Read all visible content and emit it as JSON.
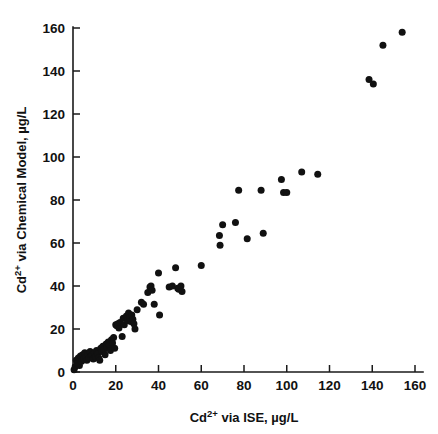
{
  "chart_data": {
    "type": "scatter",
    "title": "",
    "xlabel": "Cd2+ via ISE, µg/L",
    "ylabel": "Cd2+ via Chemical Model, µg/L",
    "xlabel_parts": {
      "prefix": "Cd",
      "sup": "2+",
      "suffix": " via ISE, µg/L"
    },
    "ylabel_parts": {
      "prefix": "Cd",
      "sup": "2+",
      "suffix": " via Chemical Model, µg/L"
    },
    "xlim": [
      0,
      163
    ],
    "ylim": [
      0,
      163
    ],
    "xticks": [
      0,
      20,
      40,
      60,
      80,
      100,
      120,
      140,
      160
    ],
    "yticks": [
      0,
      20,
      40,
      60,
      80,
      100,
      120,
      140,
      160
    ],
    "xticklabels": [
      "0",
      "20",
      "40",
      "60",
      "80",
      "100",
      "120",
      "140",
      "160"
    ],
    "yticklabels": [
      "0",
      "20",
      "40",
      "60",
      "80",
      "100",
      "120",
      "140",
      "160"
    ],
    "grid": false,
    "legend": false,
    "marker": "filled-circle",
    "marker_color": "#111111",
    "marker_size_px": 7,
    "axis_color": "#1a1a1a",
    "background": "#ffffff",
    "n_points": 94,
    "series": [
      {
        "name": "Cd measurements",
        "points": [
          [
            0.5,
            1.0
          ],
          [
            1.0,
            2.5
          ],
          [
            1.5,
            5.5
          ],
          [
            2.0,
            4.0
          ],
          [
            2.5,
            6.5
          ],
          [
            3.0,
            3.0
          ],
          [
            3.5,
            7.5
          ],
          [
            4.0,
            5.0
          ],
          [
            4.5,
            8.0
          ],
          [
            5.0,
            6.0
          ],
          [
            5.5,
            9.0
          ],
          [
            6.0,
            7.0
          ],
          [
            6.5,
            5.5
          ],
          [
            7.0,
            8.5
          ],
          [
            7.5,
            6.5
          ],
          [
            8.0,
            9.5
          ],
          [
            8.5,
            7.5
          ],
          [
            9.0,
            8.0
          ],
          [
            9.5,
            6.0
          ],
          [
            10.0,
            9.0
          ],
          [
            10.5,
            7.0
          ],
          [
            11.0,
            10.0
          ],
          [
            11.5,
            8.5
          ],
          [
            12.0,
            6.5
          ],
          [
            12.5,
            5.5
          ],
          [
            13.0,
            11.0
          ],
          [
            13.5,
            9.5
          ],
          [
            14.0,
            12.0
          ],
          [
            14.5,
            10.5
          ],
          [
            15.0,
            8.0
          ],
          [
            15.5,
            13.0
          ],
          [
            16.0,
            11.5
          ],
          [
            16.5,
            14.0
          ],
          [
            17.0,
            12.5
          ],
          [
            17.5,
            10.0
          ],
          [
            18.0,
            15.0
          ],
          [
            18.5,
            13.5
          ],
          [
            19.0,
            16.0
          ],
          [
            19.5,
            11.0
          ],
          [
            20.0,
            22.0
          ],
          [
            20.5,
            21.5
          ],
          [
            21.0,
            22.5
          ],
          [
            21.5,
            20.5
          ],
          [
            22.0,
            23.0
          ],
          [
            23.0,
            16.5
          ],
          [
            23.5,
            25.0
          ],
          [
            24.0,
            22.0
          ],
          [
            25.0,
            26.0
          ],
          [
            25.5,
            24.0
          ],
          [
            26.0,
            27.5
          ],
          [
            26.5,
            25.5
          ],
          [
            27.0,
            23.5
          ],
          [
            27.5,
            26.5
          ],
          [
            28.0,
            24.5
          ],
          [
            28.5,
            22.5
          ],
          [
            29.0,
            20.0
          ],
          [
            30.0,
            29.0
          ],
          [
            32.0,
            32.5
          ],
          [
            33.0,
            31.5
          ],
          [
            35.0,
            37.0
          ],
          [
            36.0,
            39.5
          ],
          [
            36.5,
            40.0
          ],
          [
            37.0,
            38.0
          ],
          [
            38.0,
            31.5
          ],
          [
            40.0,
            46.0
          ],
          [
            40.5,
            26.5
          ],
          [
            45.0,
            39.5
          ],
          [
            46.5,
            40.0
          ],
          [
            48.0,
            48.5
          ],
          [
            49.0,
            39.0
          ],
          [
            49.5,
            38.5
          ],
          [
            50.5,
            40.0
          ],
          [
            51.0,
            37.5
          ],
          [
            60.0,
            49.5
          ],
          [
            68.5,
            63.5
          ],
          [
            68.8,
            59.0
          ],
          [
            70.0,
            68.5
          ],
          [
            76.0,
            69.5
          ],
          [
            77.5,
            84.5
          ],
          [
            81.5,
            62.0
          ],
          [
            88.0,
            84.5
          ],
          [
            89.0,
            64.5
          ],
          [
            97.5,
            89.5
          ],
          [
            98.5,
            83.5
          ],
          [
            100.0,
            83.5
          ],
          [
            107.0,
            93.0
          ],
          [
            114.5,
            92.0
          ],
          [
            138.5,
            136.0
          ],
          [
            140.5,
            134.0
          ],
          [
            145.0,
            152.0
          ],
          [
            154.0,
            158.0
          ]
        ]
      }
    ]
  }
}
